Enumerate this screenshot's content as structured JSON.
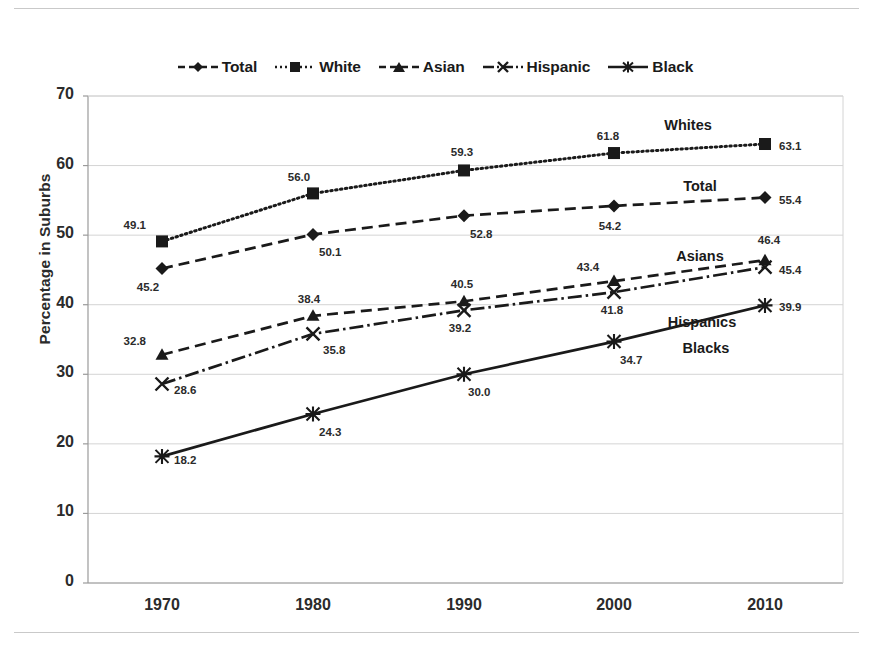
{
  "chart_data": {
    "type": "line",
    "title": "",
    "xlabel": "",
    "ylabel": "Percentage in Suburbs",
    "categories": [
      "1970",
      "1980",
      "1990",
      "2000",
      "2010"
    ],
    "ylim": [
      0,
      70
    ],
    "ytick_labels": [
      "0",
      "10",
      "20",
      "30",
      "40",
      "50",
      "60",
      "70"
    ],
    "ytick_values": [
      0,
      10,
      20,
      30,
      40,
      50,
      60,
      70
    ],
    "grid": "horizontal",
    "legend_position": "top-center",
    "series": [
      {
        "name": "Total",
        "legend_label": "Total",
        "marker": "diamond",
        "dash": "dashed",
        "values": [
          45.2,
          50.1,
          52.8,
          54.2,
          55.4
        ],
        "point_labels": [
          "45.2",
          "50.1",
          "52.8",
          "54.2",
          "55.4"
        ],
        "annotation": "Total"
      },
      {
        "name": "White",
        "legend_label": "White",
        "marker": "square",
        "dash": "dotted",
        "values": [
          49.1,
          56.0,
          59.3,
          61.8,
          63.1
        ],
        "point_labels": [
          "49.1",
          "56.0",
          "59.3",
          "61.8",
          "63.1"
        ],
        "annotation": "Whites"
      },
      {
        "name": "Asian",
        "legend_label": "Asian",
        "marker": "triangle",
        "dash": "dashed",
        "values": [
          32.8,
          38.4,
          40.5,
          43.4,
          46.4
        ],
        "point_labels": [
          "32.8",
          "38.4",
          "40.5",
          "43.4",
          "46.4"
        ],
        "annotation": "Asians"
      },
      {
        "name": "Hispanic",
        "legend_label": "Hispanic",
        "marker": "x",
        "dash": "dashdot",
        "values": [
          28.6,
          35.8,
          39.2,
          41.8,
          45.4
        ],
        "point_labels": [
          "28.6",
          "35.8",
          "39.2",
          "41.8",
          "45.4"
        ],
        "annotation": "Hispanics"
      },
      {
        "name": "Black",
        "legend_label": "Black",
        "marker": "asterisk",
        "dash": "solid",
        "values": [
          18.2,
          24.3,
          30.0,
          34.7,
          39.9
        ],
        "point_labels": [
          "18.2",
          "24.3",
          "30.0",
          "34.7",
          "39.9"
        ],
        "annotation": "Blacks"
      }
    ],
    "colors": {
      "line": "#1a1a1a",
      "grid": "#d4d4d4",
      "axis": "#9a9a9a",
      "text": "#2b2b2b",
      "background": "#ffffff"
    }
  }
}
